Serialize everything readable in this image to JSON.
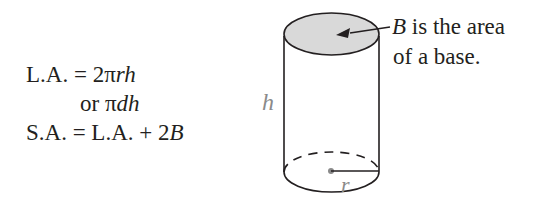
{
  "formulas": {
    "line1": {
      "lhs": "L.A. = 2π",
      "var1": "r",
      "var2": "h"
    },
    "line2": {
      "prefix": "or π",
      "var1": "d",
      "var2": "h"
    },
    "line3": {
      "lhs": "S.A. = L.A. + 2",
      "var": "B"
    }
  },
  "diagram": {
    "shape": "cylinder",
    "height_label": "h",
    "radius_label": "r",
    "base_fill": "#d9d9d9",
    "callout": {
      "var": "B",
      "line1_rest": " is the area",
      "line2": "of a base."
    }
  }
}
